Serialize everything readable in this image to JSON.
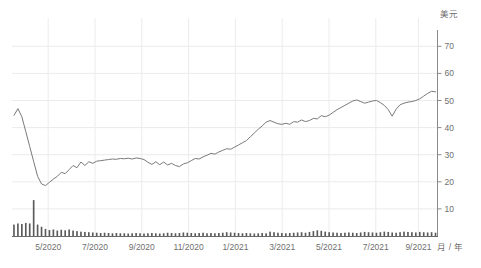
{
  "chart_data": {
    "type": "line",
    "title": "",
    "subtitle": "",
    "xlabel": "月 / 年",
    "ylabel": "美元",
    "ylim": [
      0,
      76
    ],
    "yticks": [
      10,
      20,
      30,
      40,
      50,
      60,
      70
    ],
    "ytick_labels": [
      "10",
      "20",
      "30",
      "40",
      "50",
      "60",
      "70"
    ],
    "grid": true,
    "legend_position": "none",
    "axis_side": "right",
    "xtick_labels": [
      "5/2020",
      "7/2020",
      "9/2020",
      "11/2020",
      "1/2021",
      "3/2021",
      "5/2021",
      "7/2021",
      "9/2021"
    ],
    "xtick_positions": [
      0.085,
      0.195,
      0.305,
      0.415,
      0.525,
      0.635,
      0.745,
      0.855,
      0.955
    ],
    "series": [
      {
        "name": "价格",
        "unit": "美元",
        "color": "#7a7a7a",
        "values": [
          44.5,
          47.0,
          44.0,
          38.5,
          33.0,
          27.5,
          22.0,
          19.2,
          18.6,
          19.8,
          21.0,
          22.0,
          23.5,
          23.0,
          24.5,
          26.0,
          25.2,
          27.3,
          26.0,
          27.4,
          26.8,
          27.6,
          27.8,
          28.0,
          28.2,
          28.4,
          28.3,
          28.6,
          28.5,
          28.7,
          28.4,
          28.8,
          28.6,
          28.2,
          27.2,
          26.4,
          27.4,
          26.3,
          27.3,
          26.2,
          26.8,
          26.0,
          25.6,
          26.6,
          27.0,
          27.8,
          28.6,
          28.4,
          29.2,
          29.8,
          30.5,
          30.2,
          31.0,
          31.6,
          32.2,
          32.0,
          32.8,
          33.6,
          34.4,
          35.2,
          36.6,
          38.0,
          39.4,
          40.6,
          42.0,
          42.6,
          42.0,
          41.4,
          41.2,
          41.6,
          41.2,
          42.2,
          42.0,
          42.8,
          42.2,
          42.6,
          43.4,
          43.2,
          44.4,
          44.0,
          44.6,
          45.6,
          46.6,
          47.4,
          48.2,
          49.0,
          49.8,
          50.2,
          49.6,
          49.0,
          49.4,
          49.8,
          50.0,
          49.2,
          48.2,
          46.6,
          44.2,
          46.8,
          48.4,
          49.0,
          49.4,
          49.6,
          50.0,
          50.6,
          51.6,
          52.6,
          53.4,
          53.2
        ]
      }
    ],
    "volume_series": {
      "name": "成交量",
      "color": "#5a5a5a",
      "values": [
        4.2,
        4.6,
        4.4,
        4.8,
        4.6,
        13.2,
        4.2,
        3.4,
        2.6,
        2.2,
        2.4,
        2.0,
        2.3,
        2.1,
        2.4,
        2.0,
        1.8,
        1.6,
        1.5,
        1.4,
        1.3,
        1.2,
        1.1,
        1.2,
        1.1,
        1.0,
        1.1,
        1.0,
        1.0,
        0.9,
        1.0,
        1.1,
        1.0,
        0.9,
        1.0,
        1.1,
        1.0,
        0.9,
        1.0,
        1.2,
        1.1,
        1.0,
        1.1,
        1.3,
        1.2,
        1.1,
        1.0,
        1.1,
        1.2,
        1.0,
        1.1,
        1.0,
        1.1,
        1.2,
        1.4,
        1.3,
        1.2,
        1.1,
        1.0,
        1.1,
        1.0,
        0.9,
        1.0,
        1.1,
        1.0,
        1.6,
        1.4,
        1.2,
        1.1,
        1.0,
        1.1,
        1.2,
        1.3,
        1.4,
        1.2,
        1.5,
        1.8,
        2.1,
        1.9,
        1.6,
        1.4,
        1.3,
        1.2,
        1.1,
        1.2,
        1.3,
        1.2,
        1.1,
        1.3,
        1.5,
        1.4,
        1.3,
        1.2,
        1.4,
        1.6,
        1.5,
        1.3,
        1.2,
        1.4,
        1.6,
        1.5,
        1.4,
        1.3,
        1.5,
        1.4,
        1.3,
        1.4,
        1.2
      ],
      "max": 13.2
    }
  },
  "axis": {
    "y_title": "美元",
    "x_title": "月 / 年"
  }
}
